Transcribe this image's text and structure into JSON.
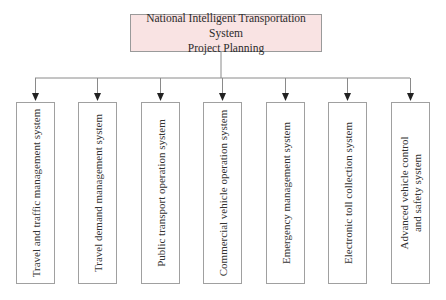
{
  "diagram": {
    "type": "hierarchy",
    "root": {
      "label": "National Intelligent Transportation System\nProject Planning",
      "fill": "#f9e3e3"
    },
    "children": [
      {
        "label": "Travel and traffic management system",
        "x": 16
      },
      {
        "label": "Travel demand management system",
        "x": 78
      },
      {
        "label": "Public transport operation system",
        "x": 141
      },
      {
        "label": "Commercial vehicle operation system",
        "x": 203
      },
      {
        "label": "Emergency management system",
        "x": 266
      },
      {
        "label": "Electronic toll collection system",
        "x": 328
      },
      {
        "label": "Advanced vehicle control\nand safety system",
        "x": 391
      }
    ],
    "line_color": "#8a8a8a",
    "arrow_color": "#222222"
  }
}
